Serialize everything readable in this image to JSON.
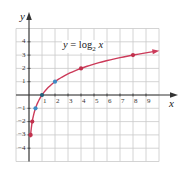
{
  "chart_data": {
    "type": "line",
    "title": "",
    "equation": {
      "lhs": "y",
      "eq": "= log",
      "base": "2",
      "var": "x"
    },
    "xlabel": "x",
    "ylabel": "y",
    "xlim": [
      -1,
      10
    ],
    "ylim": [
      -5,
      5
    ],
    "grid": true,
    "x_ticks": [
      1,
      2,
      3,
      4,
      5,
      6,
      7,
      8,
      9
    ],
    "y_ticks": [
      -4,
      -3,
      -2,
      -1,
      1,
      2,
      3,
      4
    ],
    "series": [
      {
        "name": "y = log2 x",
        "function": "log2(x)",
        "domain": [
          0.11,
          9.8
        ],
        "color": "#cc3b5a",
        "end_arrow": true
      }
    ],
    "points": [
      {
        "x": 0.125,
        "y": -3,
        "color": "#c0304c"
      },
      {
        "x": 0.25,
        "y": -2,
        "color": "#c0304c"
      },
      {
        "x": 0.5,
        "y": -1,
        "color": "#3d8ac4"
      },
      {
        "x": 1,
        "y": 0,
        "color": "#1f5f7a"
      },
      {
        "x": 2,
        "y": 1,
        "color": "#3d8ac4"
      },
      {
        "x": 4,
        "y": 2,
        "color": "#c0304c"
      },
      {
        "x": 8,
        "y": 3,
        "color": "#c0304c"
      }
    ]
  },
  "colors": {
    "grid": "#c9c9c9",
    "axis": "#333333",
    "curve": "#cc3b5a"
  }
}
